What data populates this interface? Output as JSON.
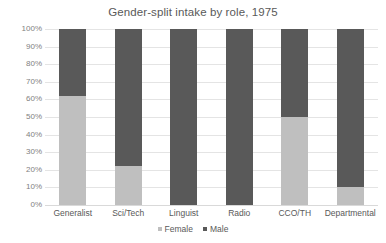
{
  "chart_data": {
    "type": "bar",
    "subtype": "stacked-100-percent",
    "title": "Gender-split intake by role, 1975",
    "xlabel": "",
    "ylabel": "",
    "categories": [
      "Generalist",
      "Sci/Tech",
      "Linguist",
      "Radio",
      "CCO/TH",
      "Departmental"
    ],
    "series": [
      {
        "name": "Female",
        "color": "#bfbfbf",
        "values": [
          62,
          22,
          0,
          0,
          50,
          10
        ]
      },
      {
        "name": "Male",
        "color": "#595959",
        "values": [
          38,
          78,
          100,
          100,
          50,
          90
        ]
      }
    ],
    "ylim": [
      0,
      100
    ],
    "ytick_labels": [
      "100%",
      "90%",
      "80%",
      "70%",
      "60%",
      "50%",
      "40%",
      "30%",
      "20%",
      "10%",
      "0%"
    ],
    "ytick_values": [
      100,
      90,
      80,
      70,
      60,
      50,
      40,
      30,
      20,
      10,
      0
    ],
    "grid": true,
    "legend_position": "bottom",
    "legend_entries": [
      "Female",
      "Male"
    ]
  },
  "colors": {
    "female": "#bfbfbf",
    "male": "#595959",
    "gridline": "#e4e4e4",
    "text": "#595959",
    "tick_text": "#7f7f7f",
    "background": "#ffffff"
  }
}
